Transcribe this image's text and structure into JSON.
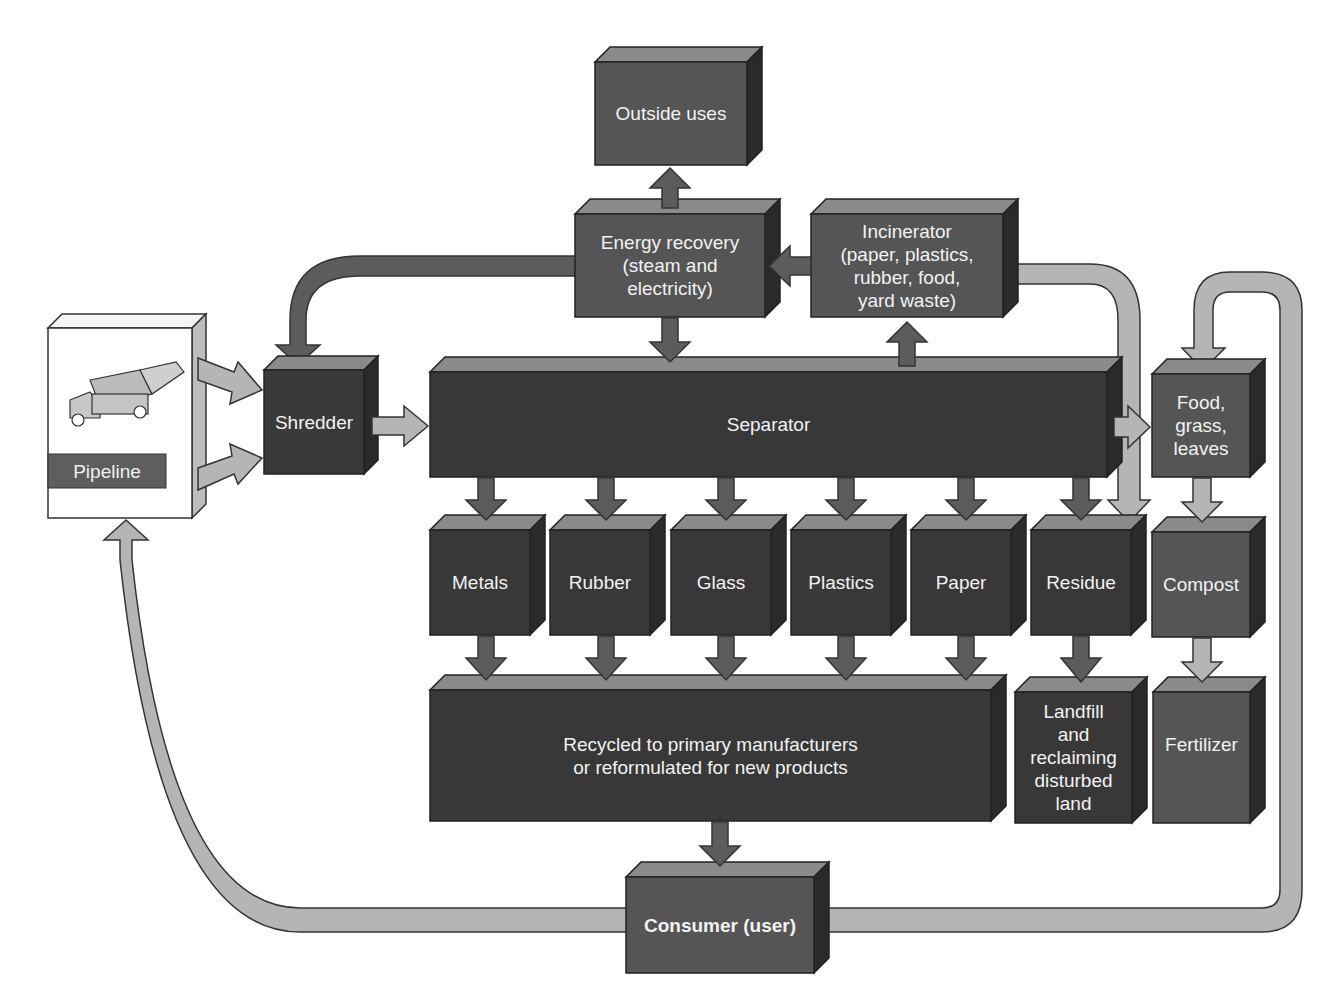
{
  "diagram": {
    "type": "flow",
    "nodes": {
      "pipeline": "Pipeline",
      "shredder": "Shredder",
      "separator": "Separator",
      "outside_uses": "Outside uses",
      "energy_recovery": "Energy recovery (steam and electricity)",
      "energy_recovery_lines": [
        "Energy recovery",
        "(steam and",
        "electricity)"
      ],
      "incinerator": "Incinerator (paper, plastics, rubber, food, yard waste)",
      "incinerator_lines": [
        "Incinerator",
        "(paper, plastics,",
        "rubber, food,",
        "yard waste)"
      ],
      "food_grass_leaves_lines": [
        "Food,",
        "grass,",
        "leaves"
      ],
      "metals": "Metals",
      "rubber": "Rubber",
      "glass": "Glass",
      "plastics": "Plastics",
      "paper": "Paper",
      "residue": "Residue",
      "compost": "Compost",
      "recycled_lines": [
        "Recycled to primary manufacturers",
        "or reformulated for new products"
      ],
      "landfill_lines": [
        "Landfill",
        "and",
        "reclaiming",
        "disturbed",
        "land"
      ],
      "fertilizer": "Fertilizer",
      "consumer": "Consumer (user)"
    },
    "edges": [
      [
        "Pipeline",
        "Shredder"
      ],
      [
        "Shredder",
        "Separator"
      ],
      [
        "Energy recovery",
        "Shredder"
      ],
      [
        "Energy recovery",
        "Outside uses"
      ],
      [
        "Energy recovery",
        "Separator"
      ],
      [
        "Incinerator",
        "Energy recovery"
      ],
      [
        "Separator",
        "Incinerator"
      ],
      [
        "Incinerator",
        "Residue"
      ],
      [
        "Separator",
        "Food, grass, leaves"
      ],
      [
        "Separator",
        "Metals"
      ],
      [
        "Separator",
        "Rubber"
      ],
      [
        "Separator",
        "Glass"
      ],
      [
        "Separator",
        "Plastics"
      ],
      [
        "Separator",
        "Paper"
      ],
      [
        "Separator",
        "Residue"
      ],
      [
        "Metals",
        "Recycled"
      ],
      [
        "Rubber",
        "Recycled"
      ],
      [
        "Glass",
        "Recycled"
      ],
      [
        "Plastics",
        "Recycled"
      ],
      [
        "Paper",
        "Recycled"
      ],
      [
        "Residue",
        "Landfill"
      ],
      [
        "Food, grass, leaves",
        "Compost"
      ],
      [
        "Compost",
        "Fertilizer"
      ],
      [
        "Recycled",
        "Consumer (user)"
      ],
      [
        "Consumer (user)",
        "Pipeline"
      ],
      [
        "Consumer (user)",
        "Food, grass, leaves"
      ]
    ]
  },
  "colors": {
    "dark_box": "#3a3a3a",
    "medium_box": "#5a5a5a",
    "box_top": "#8a8a8a",
    "box_side": "#2a2a2a",
    "light_arrow": "#b5b5b5",
    "dark_arrow": "#5c5c5c",
    "text": "#f2f2f2",
    "background": "#ffffff"
  }
}
